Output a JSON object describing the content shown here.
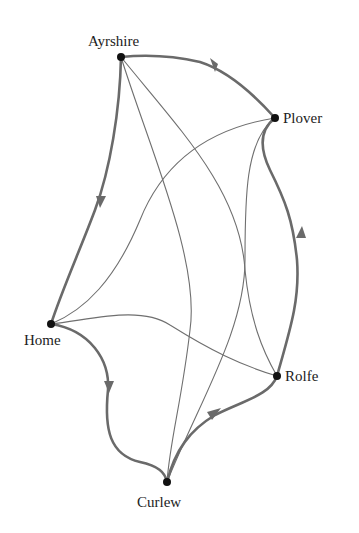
{
  "diagram": {
    "type": "graph",
    "colors": {
      "background": "#ffffff",
      "node": "#111111",
      "tour_edge": "#6a6a6a",
      "other_edge": "#6f6f6f",
      "label": "#222222"
    },
    "nodes": [
      {
        "id": "ayrshire",
        "label": "Ayrshire",
        "x": 121,
        "y": 57
      },
      {
        "id": "plover",
        "label": "Plover",
        "x": 275,
        "y": 118
      },
      {
        "id": "home",
        "label": "Home",
        "x": 51,
        "y": 324
      },
      {
        "id": "rolfe",
        "label": "Rolfe",
        "x": 277,
        "y": 376
      },
      {
        "id": "curlew",
        "label": "Curlew",
        "x": 167,
        "y": 482
      }
    ],
    "tour": [
      "ayrshire",
      "home",
      "curlew",
      "rolfe",
      "plover",
      "ayrshire"
    ],
    "tour_edges": [
      {
        "from": "ayrshire",
        "to": "home"
      },
      {
        "from": "home",
        "to": "curlew"
      },
      {
        "from": "curlew",
        "to": "rolfe"
      },
      {
        "from": "rolfe",
        "to": "plover"
      },
      {
        "from": "plover",
        "to": "ayrshire"
      }
    ],
    "other_edges": [
      {
        "from": "ayrshire",
        "to": "curlew"
      },
      {
        "from": "ayrshire",
        "to": "rolfe"
      },
      {
        "from": "plover",
        "to": "home"
      },
      {
        "from": "plover",
        "to": "curlew"
      },
      {
        "from": "home",
        "to": "rolfe"
      }
    ]
  },
  "labels": {
    "ayrshire": "Ayrshire",
    "plover": "Plover",
    "home": "Home",
    "rolfe": "Rolfe",
    "curlew": "Curlew"
  }
}
